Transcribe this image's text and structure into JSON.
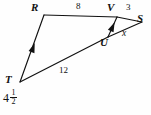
{
  "figure": {
    "type": "geometry-diagram",
    "background_color": "#fefefe",
    "stroke_color": "#111111"
  },
  "vertices": [
    {
      "id": "R",
      "label": "R",
      "x": 44,
      "y": 15,
      "label_x": 31,
      "label_y": 3
    },
    {
      "id": "T",
      "label": "T",
      "x": 20,
      "y": 82,
      "label_x": 6,
      "label_y": 76
    },
    {
      "id": "V",
      "label": "V",
      "x": 117,
      "y": 17,
      "label_x": 108,
      "label_y": 3
    },
    {
      "id": "U",
      "label": "U",
      "x": 108,
      "y": 37,
      "label_x": 101,
      "label_y": 38
    },
    {
      "id": "S",
      "label": "S",
      "x": 142,
      "y": 22,
      "label_x": 138,
      "label_y": 13
    }
  ],
  "segments": [
    {
      "id": "RV",
      "from": "R",
      "to": "V"
    },
    {
      "id": "VS",
      "from": "V",
      "to": "S"
    },
    {
      "id": "TU",
      "from": "T",
      "to": "U"
    },
    {
      "id": "US",
      "from": "U",
      "to": "S"
    },
    {
      "id": "TR",
      "from": "T",
      "to": "R"
    },
    {
      "id": "UV",
      "from": "U",
      "to": "V"
    }
  ],
  "tick_marks": [
    {
      "id": "arrow-on-TR",
      "segment": "TR",
      "x": 33,
      "y": 48
    },
    {
      "id": "arrow-on-UV",
      "segment": "UV",
      "x": 112,
      "y": 26
    }
  ],
  "measures": {
    "rv": {
      "value": "8",
      "x": 76,
      "y": 3
    },
    "vs": {
      "value": "3",
      "x": 127,
      "y": 3
    },
    "tu": {
      "value": "12",
      "x": 61,
      "y": 68
    },
    "us": {
      "value": "x",
      "x": 123,
      "y": 30
    },
    "tr": {
      "value": "4 1/2",
      "whole": "4",
      "numerator": "1",
      "denominator": "2"
    }
  }
}
